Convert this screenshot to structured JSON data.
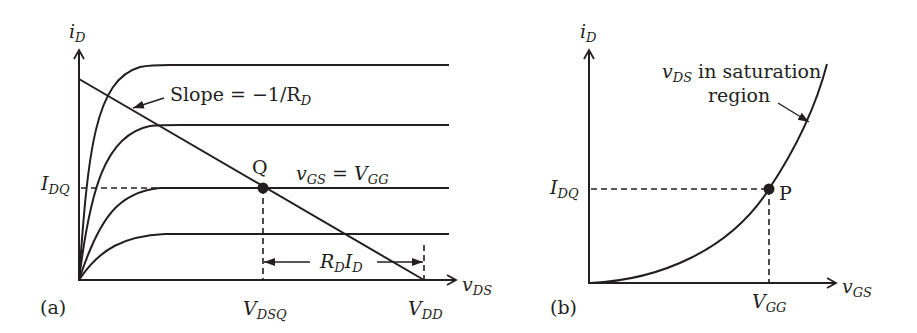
{
  "figure_a": {
    "panel_label": "(a)",
    "y_axis": {
      "symbol": "i",
      "subscript": "D"
    },
    "x_axis": {
      "symbol": "v",
      "subscript": "DS"
    },
    "slope_label": {
      "text": "Slope = −1/R",
      "subscript": "D"
    },
    "q_point_label": "Q",
    "vgs_label": {
      "lhs": "v",
      "lhs_sub": "GS",
      "eq": " = ",
      "rhs": "V",
      "rhs_sub": "GG"
    },
    "idq_label": {
      "symbol": "I",
      "subscript": "DQ"
    },
    "vdsq_label": {
      "symbol": "V",
      "subscript": "DSQ"
    },
    "vdd_label": {
      "symbol": "V",
      "subscript": "DD"
    },
    "rdid_label": {
      "r": "R",
      "r_sub": "D",
      "i": "I",
      "i_sub": "D"
    },
    "curves": [
      "top",
      "second",
      "v_GS = V_GG",
      "lowest"
    ]
  },
  "figure_b": {
    "panel_label": "(b)",
    "y_axis": {
      "symbol": "i",
      "subscript": "D"
    },
    "x_axis": {
      "symbol": "v",
      "subscript": "GS"
    },
    "curve_label": {
      "symbol": "v",
      "subscript": "DS",
      "line1_rest": " in saturation",
      "line2": "region"
    },
    "p_point_label": "P",
    "idq_label": {
      "symbol": "I",
      "subscript": "DQ"
    },
    "vgg_label": {
      "symbol": "V",
      "subscript": "GG"
    }
  }
}
